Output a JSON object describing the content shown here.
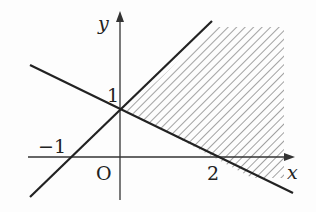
{
  "diagram": {
    "type": "linear-inequality-region",
    "axes": {
      "x_label": "x",
      "y_label": "y",
      "origin_label": "O"
    },
    "tick_labels": {
      "x_neg": "−1",
      "x_pos": "2",
      "y_pos": "1"
    },
    "lines": [
      {
        "name": "y = x + 1",
        "x_intercept": -1,
        "y_intercept": 1
      },
      {
        "name": "y = -x/2 + 1",
        "x_intercept": 2,
        "y_intercept": 1
      }
    ],
    "shaded_region": "hatched area above y = -x/2 + 1 and below y = x + 1 (to the right of their intersection at (0,1))",
    "colors": {
      "line": "#222222",
      "hatch": "#888888",
      "axis": "#333333"
    }
  }
}
